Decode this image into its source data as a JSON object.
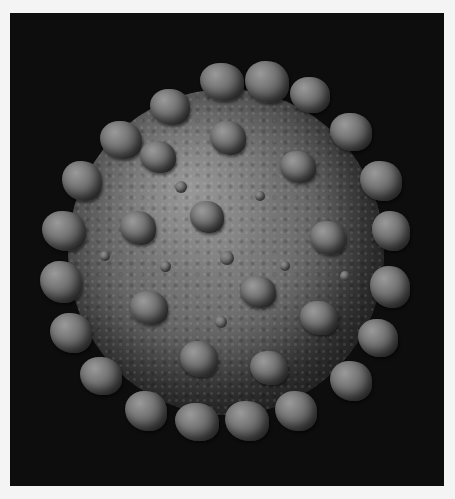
{
  "image": {
    "subject": "coronavirus particle 3D render",
    "style": "grayscale",
    "colors": {
      "background": "#0d0d0d",
      "border": "#f4f4f4",
      "surface_mid": "#6e6e6e",
      "surface_highlight": "#a0a0a0",
      "surface_shadow": "#2e2e2e"
    }
  }
}
